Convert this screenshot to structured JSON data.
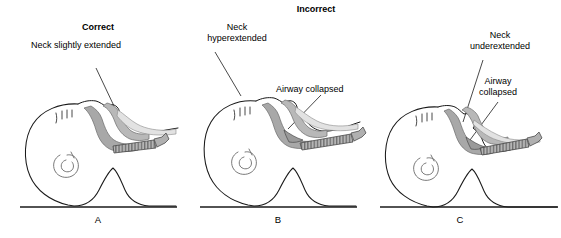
{
  "figure": {
    "heading": "Incorrect",
    "heading_x": 316,
    "heading_y": 4,
    "background_color": "#ffffff",
    "ink_color": "#1a1a1a",
    "airway_fill": "#a8a8a8",
    "tissue_fill": "#d8d8d8"
  },
  "panels": [
    {
      "id": "A",
      "letter": "A",
      "letter_x": 98,
      "letter_y": 214,
      "status": "Correct",
      "status_label": "Correct",
      "status_x": 98,
      "status_y": 22,
      "annotations": [
        {
          "name": "neck-position",
          "text": "Neck slightly extended",
          "x": 76,
          "y": 40,
          "align": "center",
          "leader": {
            "x1": 96,
            "y1": 68,
            "x2": 114,
            "y2": 106
          }
        }
      ],
      "baseline": {
        "x1": 20,
        "y1": 207,
        "x2": 177,
        "y2": 207
      }
    },
    {
      "id": "B",
      "letter": "B",
      "letter_x": 278,
      "letter_y": 214,
      "status": "Incorrect",
      "annotations": [
        {
          "name": "neck-position",
          "text": "Neck\nhyperextended",
          "line1": "Neck",
          "line2": "hyperextended",
          "x": 237,
          "y": 22,
          "align": "center",
          "leader": {
            "x1": 215,
            "y1": 52,
            "x2": 241,
            "y2": 96
          }
        },
        {
          "name": "airway-status",
          "text": "Airway collapsed",
          "x": 276,
          "y": 84,
          "align": "left",
          "leader": {
            "x1": 321,
            "y1": 95,
            "x2": 288,
            "y2": 129
          }
        }
      ],
      "baseline": {
        "x1": 200,
        "y1": 207,
        "x2": 357,
        "y2": 207
      }
    },
    {
      "id": "C",
      "letter": "C",
      "letter_x": 460,
      "letter_y": 214,
      "status": "Incorrect",
      "annotations": [
        {
          "name": "neck-position",
          "text": "Neck\nunderextended",
          "line1": "Neck",
          "line2": "underextended",
          "x": 500,
          "y": 30,
          "align": "center",
          "leader": {
            "x1": 483,
            "y1": 60,
            "x2": 463,
            "y2": 122
          }
        },
        {
          "name": "airway-status",
          "text": "Airway\ncollapsed",
          "line1": "Airway",
          "line2": "collapsed",
          "x": 498,
          "y": 76,
          "align": "center",
          "leader": {
            "x1": 498,
            "y1": 102,
            "x2": 470,
            "y2": 140
          }
        }
      ],
      "baseline": {
        "x1": 380,
        "y1": 207,
        "x2": 558,
        "y2": 207
      }
    }
  ]
}
